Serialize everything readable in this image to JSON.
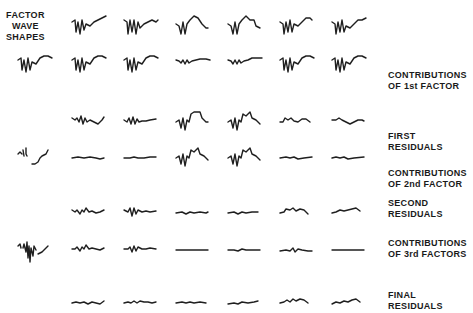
{
  "figure": {
    "corner_label": [
      "FACTOR",
      "WAVE",
      "SHAPES"
    ],
    "top_cut_text": "",
    "rows": [
      {
        "id": "observed",
        "label": []
      },
      {
        "id": "factor1",
        "label": [
          "CONTRIBUTIONS",
          "OF 1st FACTOR"
        ]
      },
      {
        "id": "res1",
        "label": [
          "FIRST",
          "RESIDUALS"
        ]
      },
      {
        "id": "factor2",
        "label": [
          "CONTRIBUTIONS",
          "OF 2nd FACTOR"
        ]
      },
      {
        "id": "res2",
        "label": [
          "SECOND",
          "RESIDUALS"
        ]
      },
      {
        "id": "factor3",
        "label": [
          "CONTRIBUTIONS",
          "OF 3rd FACTORS"
        ]
      },
      {
        "id": "final",
        "label": [
          "FINAL",
          "RESIDUALS"
        ]
      }
    ],
    "columns": 6,
    "factor_wave_shapes": [
      "factor-1-shape",
      "factor-2-shape",
      "factor-3-shape"
    ]
  }
}
